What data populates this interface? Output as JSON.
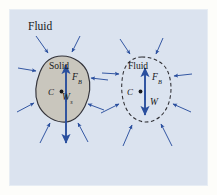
{
  "figure": {
    "caption_label": "Fluid",
    "panel_color": "#dbe3ef",
    "page_color": "#fdfdfa",
    "arrow_color": "#2a4f9e",
    "solid_fill_color": "#c9c6bd",
    "outline_color": "#2e2e33",
    "text_color": "#17171a",
    "width": 217,
    "height": 195
  },
  "left_body": {
    "name_label": "Solid",
    "buoyant_force_label": "F",
    "buoyant_force_subscript": "B",
    "weight_label": "W",
    "weight_subscript": "s",
    "centroid_label": "C",
    "outline_style": "solid",
    "fill": "shaded-gray"
  },
  "right_body": {
    "name_label": "Fluid",
    "buoyant_force_label": "F",
    "buoyant_force_subscript": "B",
    "weight_label": "W",
    "weight_subscript": "",
    "centroid_label": "C",
    "outline_style": "dashed",
    "fill": "none"
  },
  "pressure_arrows": {
    "description": "inward pressure arrows",
    "left_count": 8,
    "right_count": 8
  }
}
